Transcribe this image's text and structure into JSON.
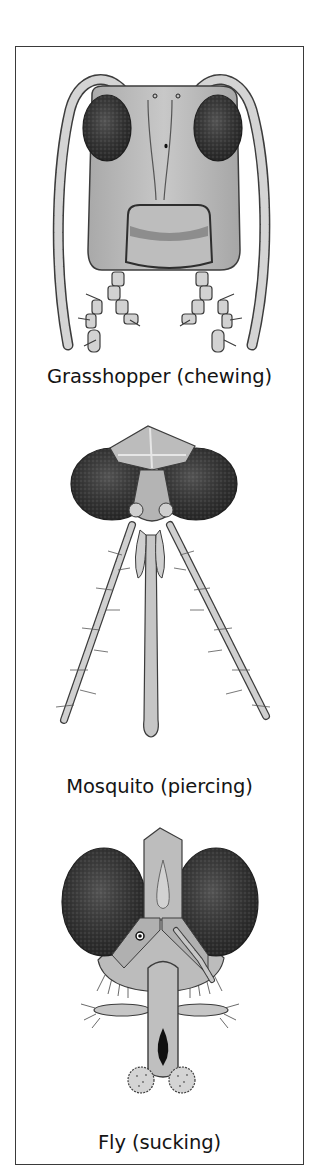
{
  "figure": {
    "panels": [
      {
        "id": "grasshopper",
        "caption": "Grasshopper (chewing)",
        "insect": "Grasshopper",
        "mouthpart_type": "chewing"
      },
      {
        "id": "mosquito",
        "caption": "Mosquito (piercing)",
        "insect": "Mosquito",
        "mouthpart_type": "piercing"
      },
      {
        "id": "fly",
        "caption": "Fly (sucking)",
        "insect": "Fly",
        "mouthpart_type": "sucking"
      }
    ]
  },
  "colors": {
    "border": "#3a3a3a",
    "background": "#ffffff",
    "text": "#141414",
    "eye_dark": "#2a2a2a",
    "head_fill": "#b9b9b9",
    "segment_fill": "#d6d6d6",
    "outline": "#3c3c3c"
  }
}
